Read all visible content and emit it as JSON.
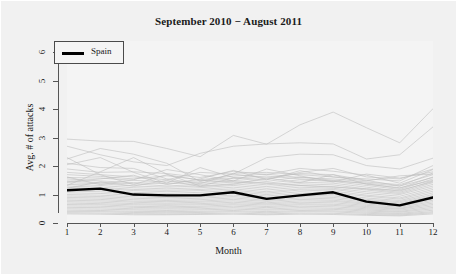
{
  "chart_data": {
    "type": "line",
    "title": "September 2010 − August 2011",
    "xlabel": "Month",
    "ylabel": "Avg. # of attacks",
    "xlim": [
      1,
      12
    ],
    "ylim": [
      0,
      6.4
    ],
    "grid": false,
    "legend": {
      "position": "top-left",
      "entries": [
        {
          "name": "Spain",
          "color": "#000000",
          "width": 2.6
        }
      ]
    },
    "x": [
      1,
      2,
      3,
      4,
      5,
      6,
      7,
      8,
      9,
      10,
      11,
      12
    ],
    "xticklabels": [
      "1",
      "2",
      "3",
      "4",
      "5",
      "6",
      "7",
      "8",
      "9",
      "10",
      "11",
      "12"
    ],
    "yticklabels": [
      "0",
      "1",
      "2",
      "3",
      "4",
      "5",
      "6"
    ],
    "yticks": [
      0,
      1,
      2,
      3,
      4,
      5,
      6
    ],
    "highlight_series": {
      "name": "Spain",
      "color": "#000000",
      "values": [
        1.15,
        1.21,
        1.0,
        0.97,
        0.97,
        1.08,
        0.85,
        0.97,
        1.08,
        0.75,
        0.62,
        0.9
      ]
    },
    "background_series_note": "Light grey spaghetti lines, one per country",
    "background_color": "#bdbdbd",
    "series": [
      {
        "name": "country-01",
        "values": [
          2.95,
          2.88,
          2.87,
          2.62,
          2.33,
          3.08,
          2.77,
          3.45,
          3.9,
          3.35,
          2.82,
          4.02
        ]
      },
      {
        "name": "country-02",
        "values": [
          2.7,
          2.4,
          2.15,
          2.02,
          2.45,
          2.7,
          2.78,
          2.82,
          2.78,
          2.25,
          2.4,
          3.38
        ]
      },
      {
        "name": "country-03",
        "values": [
          2.25,
          2.62,
          2.42,
          2.1,
          1.46,
          1.72,
          2.3,
          2.42,
          2.4,
          2.02,
          1.9,
          2.28
        ]
      },
      {
        "name": "country-04",
        "values": [
          2.1,
          1.95,
          1.92,
          1.55,
          1.38,
          1.75,
          1.78,
          1.7,
          1.62,
          1.55,
          1.48,
          2.02
        ]
      },
      {
        "name": "country-05",
        "values": [
          1.9,
          1.78,
          1.8,
          1.74,
          1.6,
          1.82,
          1.7,
          1.92,
          1.82,
          1.68,
          1.4,
          1.88
        ]
      },
      {
        "name": "country-06",
        "values": [
          1.78,
          1.7,
          1.62,
          1.52,
          1.78,
          1.72,
          1.58,
          1.74,
          1.7,
          1.5,
          1.3,
          1.76
        ]
      },
      {
        "name": "country-07",
        "values": [
          1.7,
          1.64,
          1.55,
          1.66,
          1.52,
          1.65,
          1.72,
          1.6,
          1.55,
          1.44,
          1.35,
          1.7
        ]
      },
      {
        "name": "country-08",
        "values": [
          1.6,
          1.58,
          1.5,
          1.44,
          1.48,
          1.58,
          1.46,
          1.62,
          1.5,
          1.38,
          1.22,
          1.62
        ]
      },
      {
        "name": "country-09",
        "values": [
          1.55,
          1.48,
          1.42,
          1.38,
          1.42,
          1.5,
          1.4,
          1.52,
          1.46,
          1.32,
          1.18,
          1.55
        ]
      },
      {
        "name": "country-10",
        "values": [
          1.48,
          1.42,
          1.38,
          1.3,
          1.36,
          1.44,
          1.34,
          1.44,
          1.4,
          1.26,
          1.12,
          1.48
        ]
      },
      {
        "name": "country-11",
        "values": [
          1.42,
          1.38,
          1.3,
          1.26,
          1.3,
          1.38,
          1.28,
          1.38,
          1.34,
          1.2,
          1.08,
          1.42
        ]
      },
      {
        "name": "country-12",
        "values": [
          1.36,
          1.32,
          1.24,
          1.2,
          1.24,
          1.32,
          1.22,
          1.32,
          1.28,
          1.16,
          1.04,
          1.36
        ]
      },
      {
        "name": "country-13",
        "values": [
          1.3,
          1.26,
          1.18,
          1.15,
          1.18,
          1.26,
          1.16,
          1.26,
          1.22,
          1.1,
          1.0,
          1.3
        ]
      },
      {
        "name": "country-14",
        "values": [
          1.24,
          1.22,
          1.14,
          1.1,
          1.14,
          1.2,
          1.1,
          1.2,
          1.18,
          1.04,
          0.94,
          1.24
        ]
      },
      {
        "name": "country-15",
        "values": [
          1.18,
          1.16,
          1.08,
          1.04,
          1.08,
          1.15,
          1.05,
          1.16,
          1.12,
          0.98,
          0.88,
          1.18
        ]
      },
      {
        "name": "country-16",
        "values": [
          1.12,
          1.1,
          1.02,
          0.99,
          1.02,
          1.1,
          1.0,
          1.1,
          1.06,
          0.94,
          0.84,
          1.12
        ]
      },
      {
        "name": "country-17",
        "values": [
          1.06,
          1.04,
          0.97,
          0.94,
          0.97,
          1.04,
          0.95,
          1.04,
          1.0,
          0.88,
          0.79,
          1.06
        ]
      },
      {
        "name": "country-18",
        "values": [
          1.0,
          0.98,
          0.92,
          0.89,
          0.92,
          0.98,
          0.9,
          0.98,
          0.95,
          0.83,
          0.75,
          1.0
        ]
      },
      {
        "name": "country-19",
        "values": [
          0.95,
          0.93,
          0.87,
          0.84,
          0.87,
          0.93,
          0.85,
          0.93,
          0.9,
          0.79,
          0.71,
          0.95
        ]
      },
      {
        "name": "country-20",
        "values": [
          0.9,
          0.88,
          0.82,
          0.79,
          0.82,
          0.88,
          0.8,
          0.88,
          0.85,
          0.74,
          0.67,
          0.9
        ]
      },
      {
        "name": "country-21",
        "values": [
          0.85,
          0.83,
          0.77,
          0.75,
          0.77,
          0.83,
          0.76,
          0.83,
          0.8,
          0.7,
          0.63,
          0.85
        ]
      },
      {
        "name": "country-22",
        "values": [
          0.8,
          0.78,
          0.73,
          0.7,
          0.73,
          0.78,
          0.71,
          0.78,
          0.76,
          0.66,
          0.6,
          0.8
        ]
      },
      {
        "name": "country-23",
        "values": [
          0.75,
          0.73,
          0.68,
          0.66,
          0.68,
          0.73,
          0.67,
          0.73,
          0.71,
          0.62,
          0.56,
          0.75
        ]
      },
      {
        "name": "country-24",
        "values": [
          0.7,
          0.68,
          0.64,
          0.62,
          0.64,
          0.68,
          0.63,
          0.68,
          0.66,
          0.58,
          0.52,
          0.7
        ]
      },
      {
        "name": "country-25",
        "values": [
          0.65,
          0.64,
          0.59,
          0.57,
          0.59,
          0.64,
          0.58,
          0.64,
          0.62,
          0.54,
          0.49,
          0.65
        ]
      },
      {
        "name": "country-26",
        "values": [
          0.6,
          0.59,
          0.55,
          0.53,
          0.55,
          0.59,
          0.54,
          0.59,
          0.57,
          0.5,
          0.45,
          0.6
        ]
      },
      {
        "name": "country-27",
        "values": [
          0.55,
          0.54,
          0.5,
          0.49,
          0.5,
          0.54,
          0.49,
          0.54,
          0.52,
          0.46,
          0.41,
          0.55
        ]
      },
      {
        "name": "country-28",
        "values": [
          0.5,
          0.49,
          0.46,
          0.44,
          0.46,
          0.49,
          0.45,
          0.49,
          0.48,
          0.42,
          0.38,
          0.5
        ]
      },
      {
        "name": "country-29",
        "values": [
          0.45,
          0.44,
          0.41,
          0.4,
          0.41,
          0.44,
          0.4,
          0.44,
          0.43,
          0.38,
          0.34,
          0.45
        ]
      },
      {
        "name": "country-30",
        "values": [
          0.4,
          0.4,
          0.37,
          0.36,
          0.37,
          0.4,
          0.36,
          0.4,
          0.39,
          0.34,
          0.31,
          0.4
        ]
      },
      {
        "name": "country-31",
        "values": [
          0.36,
          0.35,
          0.33,
          0.32,
          0.33,
          0.35,
          0.32,
          0.35,
          0.34,
          0.3,
          0.28,
          0.36
        ]
      },
      {
        "name": "country-32",
        "values": [
          0.32,
          0.31,
          0.29,
          0.29,
          0.3,
          0.31,
          0.29,
          0.31,
          0.3,
          0.27,
          0.25,
          0.32
        ]
      },
      {
        "name": "country-33",
        "values": [
          2.3,
          1.7,
          1.35,
          1.7,
          1.5,
          1.45,
          1.4,
          1.32,
          1.26,
          1.2,
          1.15,
          1.45
        ]
      },
      {
        "name": "country-34",
        "values": [
          1.32,
          1.8,
          2.3,
          1.72,
          1.3,
          1.58,
          1.65,
          1.55,
          1.48,
          1.4,
          1.3,
          1.6
        ]
      },
      {
        "name": "country-35",
        "values": [
          2.05,
          2.3,
          1.78,
          1.4,
          1.95,
          1.6,
          1.52,
          1.78,
          1.92,
          1.62,
          1.55,
          1.9
        ]
      },
      {
        "name": "country-36",
        "values": [
          1.62,
          1.35,
          1.52,
          1.88,
          1.7,
          1.48,
          1.9,
          1.66,
          1.44,
          1.72,
          1.58,
          1.8
        ]
      },
      {
        "name": "country-37",
        "values": [
          1.45,
          1.55,
          1.68,
          1.35,
          1.55,
          1.85,
          1.52,
          1.84,
          1.62,
          1.48,
          1.66,
          1.72
        ]
      },
      {
        "name": "country-38",
        "values": [
          1.22,
          1.45,
          1.3,
          1.5,
          1.28,
          1.36,
          1.58,
          1.42,
          1.7,
          1.36,
          1.24,
          1.5
        ]
      }
    ]
  },
  "figure": {
    "width": 457,
    "height": 275,
    "background": "#f1f1f1",
    "panel_background": "#f4f4f4"
  }
}
